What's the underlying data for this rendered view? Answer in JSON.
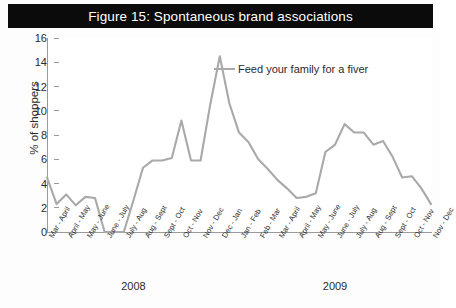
{
  "figure": {
    "title": "Figure 15: Spontaneous brand associations"
  },
  "legend": {
    "position": "inside-top-center",
    "entries": [
      {
        "label": "Feed your family for a fiver",
        "color": "#a9a9a9"
      }
    ]
  },
  "axes": {
    "y_label": "% of shoppers",
    "y_ticks": [
      "0",
      "2",
      "4",
      "6",
      "8",
      "10",
      "12",
      "14",
      "16"
    ],
    "x_group_labels": [
      "2008",
      "2009"
    ]
  },
  "colors": {
    "title_bar_background": "#0b0b0b",
    "title_text": "#ffffff",
    "series_line": "#a9a9a9",
    "axis": "#9a9a9a",
    "text": "#2b2b2b",
    "plot_background": "#ffffff"
  },
  "chart_data": {
    "type": "line",
    "title": "Figure 15: Spontaneous brand associations",
    "xlabel": "",
    "ylabel": "% of shoppers",
    "ylim": [
      0,
      16
    ],
    "ytick_step": 2,
    "grid": false,
    "legend_position": "inside-top-center",
    "categories": [
      "Mar - April",
      "April - May",
      "May - June",
      "June - July",
      "July - Aug",
      "Aug - Sept",
      "Sept - Oct",
      "Oct - Nov",
      "Nov - Dec",
      "Dec - Jan",
      "Jan - Feb",
      "Feb - Mar",
      "Mar - April",
      "April - May",
      "May - June",
      "June - July",
      "July - Aug",
      "Aug - Sept",
      "Sept - Oct",
      "Oct - Nov",
      "Nov - Dec"
    ],
    "x_group_spans": [
      {
        "label": "2008",
        "start_index": 0,
        "end_index": 9
      },
      {
        "label": "2009",
        "start_index": 10,
        "end_index": 20
      }
    ],
    "series": [
      {
        "name": "Feed your family for a fiver",
        "color": "#a9a9a9",
        "values": [
          4.5,
          2.4,
          3.1,
          2.2,
          2.9,
          0.0,
          0.0,
          5.9,
          6.0,
          9.2,
          5.8,
          14.5,
          8.2,
          5.4,
          3.4,
          2.8,
          7.2,
          8.9,
          6.2,
          5.4,
          2.3
        ]
      }
    ],
    "dense_points": {
      "note": "Line is drawn through a denser set of sampled readings between the labelled category ticks.",
      "x_fraction": [
        0.0,
        0.025,
        0.05,
        0.075,
        0.1,
        0.125,
        0.15,
        0.175,
        0.2,
        0.225,
        0.25,
        0.275,
        0.3,
        0.325,
        0.35,
        0.375,
        0.4,
        0.425,
        0.45,
        0.475,
        0.5,
        0.525,
        0.55,
        0.575,
        0.6,
        0.625,
        0.65,
        0.675,
        0.7,
        0.725,
        0.75,
        0.775,
        0.8,
        0.825,
        0.85,
        0.875,
        0.9,
        0.925,
        0.95,
        0.975,
        1.0
      ],
      "values": [
        4.5,
        2.3,
        3.1,
        2.2,
        2.9,
        2.8,
        0.0,
        0.0,
        0.0,
        2.6,
        5.3,
        5.9,
        5.9,
        6.1,
        9.2,
        5.9,
        5.9,
        10.5,
        14.5,
        10.6,
        8.2,
        7.4,
        6.0,
        5.2,
        4.3,
        3.6,
        2.8,
        2.9,
        3.2,
        6.6,
        7.2,
        8.9,
        8.2,
        8.2,
        7.2,
        7.5,
        6.2,
        4.5,
        4.6,
        3.6,
        2.3
      ]
    }
  }
}
